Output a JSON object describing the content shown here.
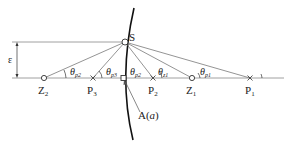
{
  "diagram": {
    "labels": {
      "S": "S",
      "epsilon": "ε",
      "Z2": "Z",
      "Z2_sub": "2",
      "P3": "P",
      "P3_sub": "3",
      "A": "A(",
      "A_arg": "a",
      "A_close": ")",
      "P2": "P",
      "P2_sub": "2",
      "Z1": "Z",
      "Z1_sub": "1",
      "P1": "P",
      "P1_sub": "1"
    },
    "angles": [
      {
        "theta": "θ",
        "sub": "p2"
      },
      {
        "theta": "θ",
        "sub": "p3"
      },
      {
        "theta": "θ",
        "sub": "p2"
      },
      {
        "theta": "θ",
        "sub": "z1"
      },
      {
        "theta": "θ",
        "sub": "p1"
      }
    ]
  }
}
